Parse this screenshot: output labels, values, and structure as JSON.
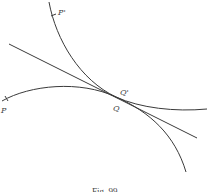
{
  "figure": {
    "caption": "Fig. 99",
    "labels": {
      "p_prime": "P'",
      "q_prime": "Q'",
      "q": "Q",
      "p": "P"
    },
    "elements": [
      {
        "name": "steep-curve",
        "through": [
          "P'",
          "Q"
        ]
      },
      {
        "name": "flat-curve",
        "through": [
          "P",
          "Q"
        ]
      },
      {
        "name": "common-tangent-line",
        "touches": "Q"
      }
    ],
    "stroke_color": "#3a3a3a"
  }
}
